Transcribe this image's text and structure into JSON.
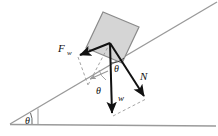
{
  "figure": {
    "type": "free-body-diagram",
    "colors": {
      "block_fill": "#d5d5d5",
      "block_stroke": "#8a8a8a",
      "vector_stroke": "#111111",
      "ground_stroke": "#9a9a9a",
      "incline_stroke": "#9a9a9a",
      "dashed_stroke": "#9a9a9a",
      "component_arrow": "#9a9a9a",
      "background": "#ffffff"
    },
    "labels": {
      "friction_force": "F",
      "friction_force_subscript": "w",
      "normal_force": "N",
      "weight": "w",
      "angle_incline": "θ",
      "angle_between_weight_and_normal": "θ",
      "angle_between_weight_and_slope": "θ"
    },
    "vectors": [
      {
        "name": "friction-force",
        "label": "F",
        "subscript": "w",
        "origin": [
          110,
          43
        ],
        "tip": [
          78,
          56
        ],
        "direction": "up-slope-left",
        "style": "solid"
      },
      {
        "name": "normal-force",
        "label": "N",
        "origin": [
          110,
          43
        ],
        "tip": [
          146,
          99
        ],
        "direction": "down-right-perpendicular",
        "style": "solid"
      },
      {
        "name": "weight",
        "label": "w",
        "origin": [
          110,
          43
        ],
        "tip": [
          113,
          117
        ],
        "direction": "straight-down",
        "style": "solid"
      }
    ],
    "construction_lines": [
      {
        "name": "dashed-from-friction-tip",
        "from": [
          78,
          56
        ],
        "to": [
          88,
          85
        ],
        "style": "dashed"
      },
      {
        "name": "dashed-weight-to-normal",
        "from": [
          113,
          117
        ],
        "to": [
          146,
          99
        ],
        "style": "dashed"
      },
      {
        "name": "dashed-slope-parallel",
        "from": [
          88,
          85
        ],
        "to": [
          110,
          43
        ],
        "style": "dashed"
      },
      {
        "name": "component-arrow-along-slope",
        "from": [
          108,
          72
        ],
        "to": [
          88,
          80
        ],
        "style": "solid-gray-arrow"
      }
    ],
    "geometry": {
      "incline_line": {
        "from": [
          10,
          124
        ],
        "to": [
          217,
          2
        ]
      },
      "ground_line": {
        "from": [
          10,
          124
        ],
        "to": [
          216,
          126
        ]
      },
      "vertical_tick": {
        "from": [
          38,
          108
        ],
        "to": [
          38,
          124
        ]
      },
      "block": {
        "corners": [
          [
            86,
            48
          ],
          [
            103,
            12
          ],
          [
            139,
            27
          ],
          [
            122,
            63
          ]
        ],
        "rotation_deg": -23
      }
    },
    "angle_arcs": [
      {
        "name": "incline-base-angle",
        "at": [
          10,
          124
        ],
        "label": "θ"
      },
      {
        "name": "weight-normal-angle",
        "at": [
          110,
          43
        ],
        "label": "θ"
      },
      {
        "name": "weight-slope-angle",
        "at": [
          94,
          72
        ],
        "label": "θ"
      }
    ]
  }
}
